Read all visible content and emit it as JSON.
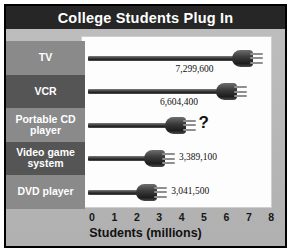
{
  "chart": {
    "title": "College Students Plug In",
    "x_axis_title": "Students (millions)"
  },
  "chart_data": {
    "type": "bar",
    "orientation": "horizontal",
    "title": "College Students Plug In",
    "xlabel": "Students (millions)",
    "ylabel": "",
    "xlim": [
      0,
      8
    ],
    "xticks": [
      "0",
      "1",
      "2",
      "3",
      "4",
      "5",
      "6",
      "7",
      "8"
    ],
    "grid": false,
    "legend": false,
    "categories": [
      "TV",
      "VCR",
      "Portable CD player",
      "Video game system",
      "DVD player"
    ],
    "values": [
      7299600,
      6604400,
      null,
      3389100,
      3041500
    ],
    "value_labels": [
      "7,299,600",
      "6,604,400",
      "?",
      "3,389,100",
      "3,041,500"
    ],
    "unknown_category": "Portable CD player",
    "unknown_marker": "?"
  },
  "rows": [
    {
      "label": "TV",
      "label_line1": "TV",
      "label_line2": "",
      "value_text": "7,299,600",
      "value_millions": 7.2996,
      "is_unknown": false
    },
    {
      "label": "VCR",
      "label_line1": "VCR",
      "label_line2": "",
      "value_text": "6,604,400",
      "value_millions": 6.6044,
      "is_unknown": false
    },
    {
      "label": "Portable CD player",
      "label_line1": "Portable CD",
      "label_line2": "player",
      "value_text": "?",
      "value_millions": 4.35,
      "is_unknown": true
    },
    {
      "label": "Video game system",
      "label_line1": "Video game",
      "label_line2": "system",
      "value_text": "3,389,100",
      "value_millions": 3.3891,
      "is_unknown": false
    },
    {
      "label": "DVD player",
      "label_line1": "DVD player",
      "label_line2": "",
      "value_text": "3,041,500",
      "value_millions": 3.0415,
      "is_unknown": false
    }
  ],
  "colors": {
    "title_bar": "#262626",
    "title_text": "#ffffff",
    "panel_background": "#b4b4b4",
    "plot_background": "#fdfdfd",
    "band_light": "#8a8a8a",
    "band_dark": "#555555",
    "plug": "#202020",
    "axis_text": "#171717"
  }
}
